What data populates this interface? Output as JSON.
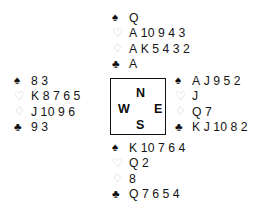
{
  "diagram": {
    "type": "bridge-deal",
    "suit_glyphs": {
      "spades": "♠",
      "hearts": "♡",
      "diamonds": "♢",
      "clubs": "♣"
    },
    "suit_colors": {
      "spades": "#0d0d0d",
      "hearts": "#c9c9c9",
      "diamonds": "#c9c9c9",
      "clubs": "#0d0d0d"
    },
    "text_color": "#141414",
    "background": "#ffffff",
    "border_color": "#111111"
  },
  "compass": {
    "north": "N",
    "west": "W",
    "east": "E",
    "south": "S"
  },
  "hands": {
    "north": {
      "label": "North",
      "spades": {
        "symbol": "♠",
        "cards": "Q"
      },
      "hearts": {
        "symbol": "♡",
        "cards": "A 10 9 4 3"
      },
      "diamonds": {
        "symbol": "♢",
        "cards": "A K 5 4 3 2"
      },
      "clubs": {
        "symbol": "♣",
        "cards": "A"
      }
    },
    "west": {
      "label": "West",
      "spades": {
        "symbol": "♠",
        "cards": "8 3"
      },
      "hearts": {
        "symbol": "♡",
        "cards": "K 8 7 6 5"
      },
      "diamonds": {
        "symbol": "♢",
        "cards": "J 10 9 6"
      },
      "clubs": {
        "symbol": "♣",
        "cards": "9 3"
      }
    },
    "east": {
      "label": "East",
      "spades": {
        "symbol": "♠",
        "cards": "A J 9 5 2"
      },
      "hearts": {
        "symbol": "♡",
        "cards": "J"
      },
      "diamonds": {
        "symbol": "♢",
        "cards": "Q 7"
      },
      "clubs": {
        "symbol": "♣",
        "cards": "K J 10 8 2"
      }
    },
    "south": {
      "label": "South",
      "spades": {
        "symbol": "♠",
        "cards": "K 10 7 6 4"
      },
      "hearts": {
        "symbol": "♡",
        "cards": "Q 2"
      },
      "diamonds": {
        "symbol": "♢",
        "cards": "8"
      },
      "clubs": {
        "symbol": "♣",
        "cards": "Q 7 6 5 4"
      }
    }
  }
}
